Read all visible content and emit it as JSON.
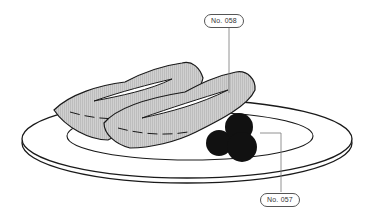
{
  "labels": {
    "upper": "No. 058",
    "lower": "No. 057"
  },
  "colors": {
    "outline": "#1a1a1a",
    "food_fill": "#c8c8c8",
    "berry": "#111111",
    "leader": "#777777",
    "background": "#ffffff"
  }
}
